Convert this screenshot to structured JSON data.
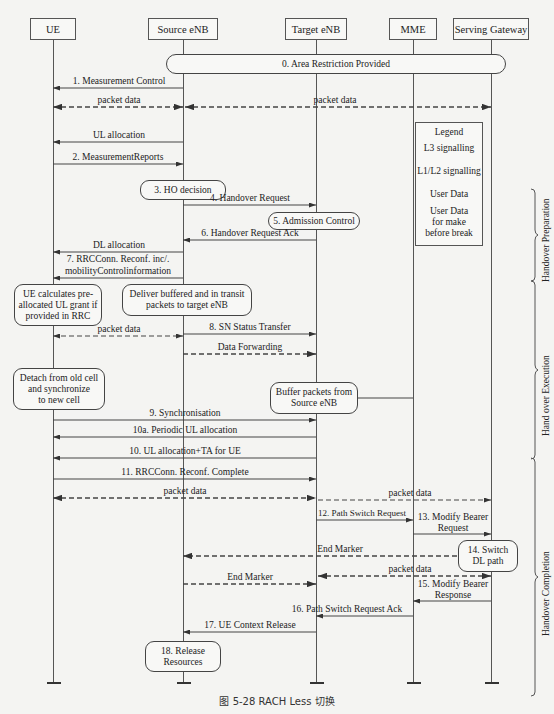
{
  "participants": [
    {
      "id": "ue",
      "label": "UE",
      "x": 53,
      "box_left": 30,
      "box_width": 46
    },
    {
      "id": "source",
      "label": "Source eNB",
      "x": 183,
      "box_left": 148,
      "box_width": 70
    },
    {
      "id": "target",
      "label": "Target eNB",
      "x": 316,
      "box_left": 285,
      "box_width": 62
    },
    {
      "id": "mme",
      "label": "MME",
      "x": 413,
      "box_left": 389,
      "box_width": 48
    },
    {
      "id": "sgw",
      "label": "Serving Gateway",
      "x": 491,
      "box_left": 453,
      "box_width": 76
    }
  ],
  "steps": {
    "s0": "0. Area Restriction Provided",
    "s1": "1. Measurement Control",
    "pd1": "packet data",
    "pd2": "packet data",
    "ul_alloc": "UL allocation",
    "s2": "2. MeasurementReports",
    "s3": "3. HO decision",
    "s4": "4. Handover Request",
    "s5": "5. Admission Control",
    "s6": "6. Handover Request Ack",
    "dl_alloc": "DL allocation",
    "s7a": "7. RRCConn. Reconf. inc/.",
    "s7b": "mobilityControlinformation",
    "ue_calc_1": "UE calculates pre-",
    "ue_calc_2": "allocated UL grant if",
    "ue_calc_3": "provided in RRC",
    "deliver_1": "Deliver buffered and in transit",
    "deliver_2": "packets to target eNB",
    "pd3": "packet data",
    "s8": "8. SN Status Transfer",
    "data_fwd": "Data Forwarding",
    "detach_1": "Detach from old cell",
    "detach_2": "and synchronize",
    "detach_3": "to new cell",
    "buffer_1": "Buffer packets from",
    "buffer_2": "Source eNB",
    "s9": "9. Synchronisation",
    "s10a": "10a. Periodic UL allocation",
    "s10": "10. UL allocation+TA for UE",
    "s11": "11. RRCConn. Reconf. Complete",
    "pd4": "packet data",
    "pd5": "packet data",
    "s12": "12. Path Switch Request",
    "s13a": "13. Modify Bearer",
    "s13b": "Request",
    "end_marker_1": "End Marker",
    "s14a": "14. Switch",
    "s14b": "DL path",
    "pd6": "packet data",
    "end_marker_2": "End Marker",
    "s15a": "15. Modify Bearer",
    "s15b": "Response",
    "s16": "16. Path Switch Request Ack",
    "s17": "17. UE Context Release",
    "s18a": "18. Release",
    "s18b": "Resources"
  },
  "legend": {
    "title": "Legend",
    "l3": "L3 signalling",
    "l1l2": "L1/L2 signalling",
    "user_data": "User Data",
    "mbb_1": "User Data",
    "mbb_2": "for make",
    "mbb_3": "before break"
  },
  "phases": {
    "preparation": "Handover Preparation",
    "execution": "Hand over  Execution",
    "completion": "Handover Completion"
  },
  "caption": "图 5-28   RACH Less 切换",
  "colors": {
    "line": "#444444",
    "background": "#f4f4f2",
    "box_fill": "#f8f8f6"
  }
}
